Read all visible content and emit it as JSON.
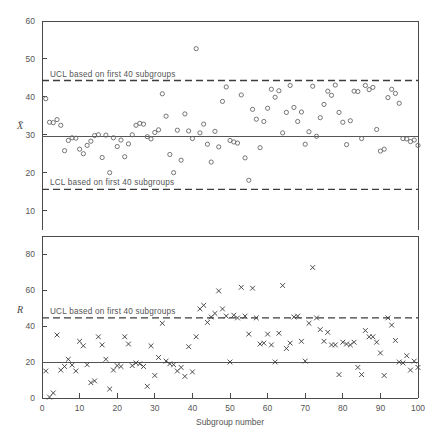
{
  "figure": {
    "background": "#ffffff",
    "ink_color": "#4a4a4a"
  },
  "chart_data": [
    {
      "type": "scatter",
      "id": "xbar-chart",
      "title": "",
      "xlabel": "Subgroup number",
      "ylabel": "X̄",
      "ylabel_plain": "X-bar",
      "xlim": [
        0,
        100
      ],
      "ylim": [
        0,
        60
      ],
      "xticks": [
        0,
        10,
        20,
        30,
        40,
        50,
        60,
        70,
        80,
        90,
        100
      ],
      "xticklabels": [
        "0",
        "10",
        "20",
        "30",
        "40",
        "50",
        "60",
        "70",
        "80",
        "90",
        "100"
      ],
      "yticks": [
        10,
        20,
        30,
        40,
        50,
        60
      ],
      "yticklabels": [
        "10",
        "20",
        "30",
        "40",
        "50",
        "60"
      ],
      "grid": false,
      "marker": "open-circle",
      "center_line": 29.6,
      "upper_control_limit": 44.3,
      "lower_control_limit": 15.6,
      "ucl_annotation": "UCL based on first 40 subgroups",
      "lcl_annotation": "LCL based on first 40 subgroups",
      "x": [
        1,
        2,
        3,
        4,
        5,
        6,
        7,
        8,
        9,
        10,
        11,
        12,
        13,
        14,
        15,
        16,
        17,
        18,
        19,
        20,
        21,
        22,
        23,
        24,
        25,
        26,
        27,
        28,
        29,
        30,
        31,
        32,
        33,
        34,
        35,
        36,
        37,
        38,
        39,
        40,
        41,
        42,
        43,
        44,
        45,
        46,
        47,
        48,
        49,
        50,
        51,
        52,
        53,
        54,
        55,
        56,
        57,
        58,
        59,
        60,
        61,
        62,
        63,
        64,
        65,
        66,
        67,
        68,
        69,
        70,
        71,
        72,
        73,
        74,
        75,
        76,
        77,
        78,
        79,
        80,
        81,
        82,
        83,
        84,
        85,
        86,
        87,
        88,
        89,
        90,
        91,
        92,
        93,
        94,
        95,
        96,
        97,
        98,
        99,
        100
      ],
      "values": [
        39.5,
        33.3,
        33.2,
        34.0,
        32.5,
        25.8,
        28.5,
        29.2,
        29.1,
        26.2,
        25.0,
        27.2,
        28.3,
        29.8,
        30.0,
        24.0,
        29.9,
        20.0,
        29.2,
        26.9,
        28.6,
        24.2,
        27.6,
        30.0,
        32.5,
        33.0,
        32.8,
        29.5,
        28.9,
        30.6,
        31.3,
        40.8,
        34.9,
        24.8,
        20.0,
        31.2,
        23.3,
        35.5,
        31.0,
        29.0,
        52.7,
        30.5,
        32.8,
        27.5,
        22.8,
        30.9,
        26.8,
        38.8,
        42.6,
        28.5,
        28.1,
        27.8,
        40.5,
        23.9,
        18.0,
        36.7,
        34.1,
        26.6,
        33.5,
        37.0,
        42.0,
        39.9,
        41.6,
        30.5,
        35.9,
        43.0,
        37.2,
        33.5,
        36.0,
        27.5,
        30.8,
        42.8,
        29.6,
        34.5,
        38.0,
        41.5,
        40.4,
        43.1,
        35.9,
        33.3,
        27.4,
        33.7,
        41.5,
        41.4,
        29.0,
        43.0,
        41.9,
        42.5,
        31.4,
        25.7,
        26.2,
        39.8,
        42.0,
        40.9,
        38.3,
        29.0,
        28.9,
        28.2,
        28.6,
        27.2
      ]
    },
    {
      "type": "scatter",
      "id": "r-chart",
      "title": "",
      "xlabel": "Subgroup number",
      "ylabel": "R",
      "xlim": [
        0,
        100
      ],
      "ylim": [
        0,
        93
      ],
      "xticks": [
        0,
        10,
        20,
        30,
        40,
        50,
        60,
        70,
        80,
        90,
        100
      ],
      "xticklabels": [
        "0",
        "10",
        "20",
        "30",
        "40",
        "50",
        "60",
        "70",
        "80",
        "90",
        "100"
      ],
      "yticks": [
        0,
        20,
        40,
        60,
        80
      ],
      "yticklabels": [
        "0",
        "20",
        "40",
        "60",
        "80"
      ],
      "grid": false,
      "marker": "cross",
      "center_line": 20.0,
      "upper_control_limit": 44.5,
      "ucl_annotation": "UCL based on first 40 subgroups",
      "x": [
        1,
        2,
        3,
        4,
        5,
        6,
        7,
        8,
        9,
        10,
        11,
        12,
        13,
        14,
        15,
        16,
        17,
        18,
        19,
        20,
        21,
        22,
        23,
        24,
        25,
        26,
        27,
        28,
        29,
        30,
        31,
        32,
        33,
        34,
        35,
        36,
        37,
        38,
        39,
        40,
        41,
        42,
        43,
        44,
        45,
        46,
        47,
        48,
        49,
        50,
        51,
        52,
        53,
        54,
        55,
        56,
        57,
        58,
        59,
        60,
        61,
        62,
        63,
        64,
        65,
        66,
        67,
        68,
        69,
        70,
        71,
        72,
        73,
        74,
        75,
        76,
        77,
        78,
        79,
        80,
        81,
        82,
        83,
        84,
        85,
        86,
        87,
        88,
        89,
        90,
        91,
        92,
        93,
        94,
        95,
        96,
        97,
        98,
        99,
        100
      ],
      "values": [
        15.0,
        0.5,
        2.8,
        35.0,
        15.5,
        17.5,
        21.5,
        18.3,
        15.0,
        31.5,
        29.0,
        18.5,
        8.5,
        9.5,
        34.0,
        29.5,
        21.5,
        5.0,
        15.5,
        18.0,
        17.5,
        34.0,
        30.0,
        18.0,
        19.5,
        19.0,
        17.5,
        6.5,
        29.0,
        12.5,
        22.5,
        41.5,
        20.5,
        19.0,
        18.5,
        15.0,
        17.0,
        12.0,
        28.5,
        14.5,
        34.0,
        49.5,
        51.5,
        42.0,
        45.0,
        47.0,
        59.5,
        49.5,
        45.5,
        20.0,
        46.0,
        44.5,
        61.5,
        45.5,
        35.5,
        61.0,
        44.5,
        30.0,
        30.5,
        35.5,
        29.5,
        20.0,
        36.0,
        62.5,
        27.5,
        30.5,
        45.0,
        45.5,
        31.5,
        20.5,
        41.5,
        72.5,
        44.5,
        38.0,
        31.5,
        36.5,
        29.5,
        29.5,
        13.0,
        31.0,
        30.0,
        29.5,
        31.0,
        17.0,
        13.0,
        37.5,
        34.0,
        34.0,
        31.0,
        25.0,
        12.5,
        44.5,
        40.5,
        32.0,
        20.0,
        19.5,
        23.5,
        15.5,
        20.5,
        17.0
      ]
    }
  ],
  "labels": {
    "x_axis_title": "Subgroup number",
    "xbar_series_label": "X̄",
    "r_series_label": "R",
    "ucl_text": "UCL based on first 40 subgroups",
    "lcl_text": "LCL based on first 40 subgroups"
  }
}
